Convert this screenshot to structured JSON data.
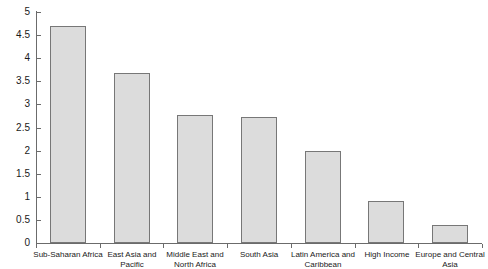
{
  "chart_data": {
    "type": "bar",
    "title": "",
    "xlabel": "",
    "ylabel": "",
    "ylim": [
      0,
      5
    ],
    "grid": false,
    "legend": null,
    "categories": [
      "Sub-Saharan Africa",
      "East Asia and Pacific",
      "Middle East and\nNorth Africa",
      "South Asia",
      "Latin America and\nCaribbean",
      "High Income",
      "Europe and Central\nAsia"
    ],
    "values": [
      4.7,
      3.69,
      2.78,
      2.73,
      1.99,
      0.9,
      0.4
    ],
    "y_ticks": [
      0,
      0.5,
      1,
      1.5,
      2,
      2.5,
      3,
      3.5,
      4,
      4.5,
      5
    ],
    "y_tick_labels": [
      "0",
      "0.5",
      "1",
      "1.5",
      "2",
      "2.5",
      "3",
      "3.5",
      "4",
      "4.5",
      "5"
    ],
    "colors": {
      "bar_fill": "#dcdcdc",
      "bar_border": "#777777",
      "axis": "#6b6b6b",
      "text": "#1a1a1a",
      "background": "#ffffff"
    }
  }
}
